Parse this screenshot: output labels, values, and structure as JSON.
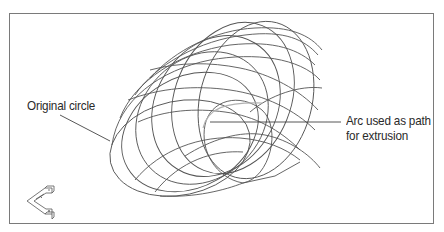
{
  "figure": {
    "type": "3D wireframe extrusion illustration",
    "callouts": {
      "original_circle": "Original circle",
      "arc_path_line1": "Arc used as path",
      "arc_path_line2": "for extrusion"
    },
    "ucs_icon": "ucs-icon",
    "colors": {
      "frame": "#7a7a7a",
      "wireframe": "#555555",
      "path_arc": "#b0b0b0",
      "text": "#2a2a2a"
    }
  }
}
